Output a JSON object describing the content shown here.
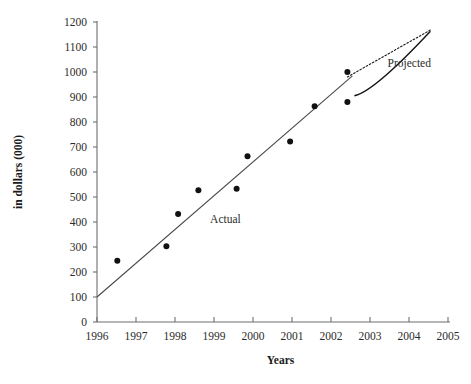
{
  "chart_data": {
    "type": "scatter",
    "title": "",
    "xlabel": "Years",
    "ylabel": "in dollars (000)",
    "xlim": [
      1996,
      2005
    ],
    "ylim": [
      0,
      1200
    ],
    "grid": false,
    "legend": "inline-annotations",
    "x_ticks": [
      "1996",
      "1997",
      "1998",
      "1999",
      "2000",
      "2001",
      "2002",
      "2003",
      "2004",
      "2005"
    ],
    "x_tick_values": [
      1996,
      1997,
      1998,
      1999,
      2000,
      2001,
      2002,
      2003,
      2004,
      2005
    ],
    "y_ticks": [
      "0",
      "100",
      "200",
      "300",
      "400",
      "500",
      "600",
      "700",
      "800",
      "900",
      "1000",
      "1100",
      "1200"
    ],
    "y_tick_values": [
      0,
      100,
      200,
      300,
      400,
      500,
      600,
      700,
      800,
      900,
      1000,
      1100,
      1200
    ],
    "series": [
      {
        "name": "Actual",
        "type": "scatter",
        "marker": "filled-circle",
        "color": "#111111",
        "points": [
          {
            "x": 1996.52,
            "y": 245
          },
          {
            "x": 1997.78,
            "y": 303
          },
          {
            "x": 1998.08,
            "y": 432
          },
          {
            "x": 1998.6,
            "y": 527
          },
          {
            "x": 1999.58,
            "y": 533
          },
          {
            "x": 1999.86,
            "y": 663
          },
          {
            "x": 2000.95,
            "y": 722
          },
          {
            "x": 2001.58,
            "y": 863
          },
          {
            "x": 2002.42,
            "y": 1000
          },
          {
            "x": 2002.42,
            "y": 880
          }
        ]
      },
      {
        "name": "Actual trend",
        "type": "line",
        "color": "#4a4a4a",
        "points": [
          {
            "x": 1996.0,
            "y": 100
          },
          {
            "x": 2002.55,
            "y": 985
          }
        ]
      },
      {
        "name": "Projected upper bound",
        "type": "line",
        "style": "dotted",
        "color": "#151515",
        "points": [
          {
            "x": 2002.42,
            "y": 980
          },
          {
            "x": 2004.55,
            "y": 1168
          }
        ]
      },
      {
        "name": "Projected lower bound",
        "type": "line",
        "style": "solid",
        "color": "#151515",
        "points": [
          {
            "x": 2002.6,
            "y": 905
          },
          {
            "x": 2003.1,
            "y": 945
          },
          {
            "x": 2004.55,
            "y": 1163
          }
        ]
      }
    ],
    "annotations": [
      {
        "text": "Actual",
        "x": 1998.9,
        "y": 395
      },
      {
        "text": "Projected",
        "x": 2003.45,
        "y": 1020
      }
    ]
  },
  "axis": {
    "x_title": "Years",
    "y_title": "in dollars (000)"
  },
  "labels": {
    "actual": "Actual",
    "projected": "Projected"
  }
}
